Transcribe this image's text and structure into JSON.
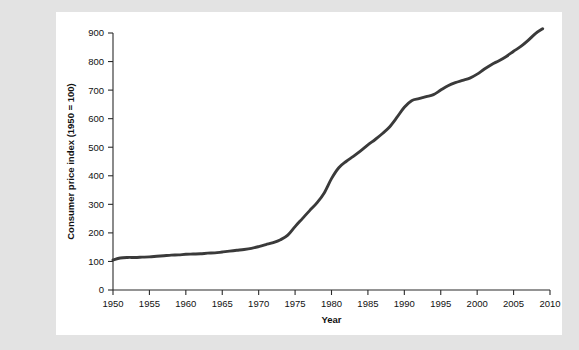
{
  "figure": {
    "panel_background": "#ffffff",
    "page_background": "#e3e3e3"
  },
  "chart_data": {
    "type": "line",
    "title": "",
    "xlabel": "Year",
    "ylabel": "Consumer price index (1950 = 100)",
    "xlim": [
      1950,
      2010
    ],
    "ylim": [
      0,
      900
    ],
    "xticks": [
      1950,
      1955,
      1960,
      1965,
      1970,
      1975,
      1980,
      1985,
      1990,
      1995,
      2000,
      2005,
      2010
    ],
    "yticks": [
      0,
      100,
      200,
      300,
      400,
      500,
      600,
      700,
      800,
      900
    ],
    "xtick_labels": [
      "1950",
      "1955",
      "1960",
      "1965",
      "1970",
      "1975",
      "1980",
      "1985",
      "1990",
      "1995",
      "2000",
      "2005",
      "2010"
    ],
    "ytick_labels": [
      "0",
      "100",
      "200",
      "300",
      "400",
      "500",
      "600",
      "700",
      "800",
      "900"
    ],
    "grid": false,
    "legend": null,
    "line_color": "#3a3a3a",
    "line_width": 2.9,
    "x": [
      1950,
      1951,
      1952,
      1953,
      1954,
      1955,
      1956,
      1957,
      1958,
      1959,
      1960,
      1961,
      1962,
      1963,
      1964,
      1965,
      1966,
      1967,
      1968,
      1969,
      1970,
      1971,
      1972,
      1973,
      1974,
      1975,
      1976,
      1977,
      1978,
      1979,
      1980,
      1981,
      1982,
      1983,
      1984,
      1985,
      1986,
      1987,
      1988,
      1989,
      1990,
      1991,
      1992,
      1993,
      1994,
      1995,
      1996,
      1997,
      1998,
      1999,
      2000,
      2001,
      2002,
      2003,
      2004,
      2005,
      2006,
      2007,
      2008,
      2009
    ],
    "values": [
      105,
      112,
      114,
      114,
      115,
      116,
      118,
      120,
      122,
      123,
      125,
      126,
      127,
      129,
      130,
      133,
      136,
      139,
      142,
      146,
      152,
      159,
      166,
      176,
      192,
      222,
      250,
      278,
      305,
      340,
      390,
      428,
      450,
      468,
      487,
      508,
      527,
      548,
      572,
      605,
      640,
      663,
      670,
      677,
      684,
      700,
      715,
      726,
      734,
      742,
      756,
      774,
      790,
      803,
      818,
      836,
      853,
      874,
      898,
      915
    ]
  }
}
